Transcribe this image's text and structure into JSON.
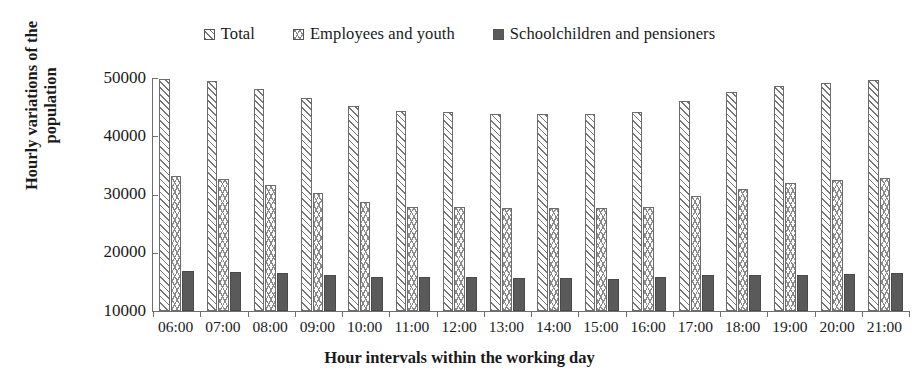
{
  "chart_data": {
    "type": "bar",
    "title": "",
    "xlabel": "Hour intervals within the working day",
    "ylabel": "Hourly variations of the population",
    "ylim": [
      10000,
      50000
    ],
    "ytick_step": 10000,
    "yticks": [
      "10000",
      "20000",
      "30000",
      "40000",
      "50000"
    ],
    "grid": false,
    "legend_position": "top-center",
    "categories": [
      "06:00",
      "07:00",
      "08:00",
      "09:00",
      "10:00",
      "11:00",
      "12:00",
      "13:00",
      "14:00",
      "15:00",
      "16:00",
      "17:00",
      "18:00",
      "19:00",
      "20:00",
      "21:00"
    ],
    "series": [
      {
        "name": "Total",
        "pattern": "diagonal-hatch",
        "color": "#777777",
        "values": [
          49900,
          49500,
          48200,
          46600,
          45200,
          44300,
          44100,
          43900,
          43800,
          43900,
          44200,
          46000,
          47600,
          48600,
          49200,
          49700
        ]
      },
      {
        "name": "Employees and youth",
        "pattern": "chevron-hatch",
        "color": "#8a8a8a",
        "values": [
          33100,
          32700,
          31700,
          30200,
          28800,
          27900,
          27900,
          27700,
          27600,
          27600,
          27800,
          29800,
          31000,
          32000,
          32500,
          32800
        ]
      },
      {
        "name": "Schoolchildren and pensioners",
        "pattern": "solid",
        "color": "#5a5a5a",
        "values": [
          16800,
          16700,
          16500,
          16200,
          15900,
          15800,
          15800,
          15700,
          15600,
          15500,
          15800,
          16100,
          16200,
          16200,
          16400,
          16600
        ]
      }
    ]
  },
  "legend": {
    "items": [
      {
        "label": "Total"
      },
      {
        "label": "Employees and youth"
      },
      {
        "label": "Schoolchildren and pensioners"
      }
    ]
  }
}
